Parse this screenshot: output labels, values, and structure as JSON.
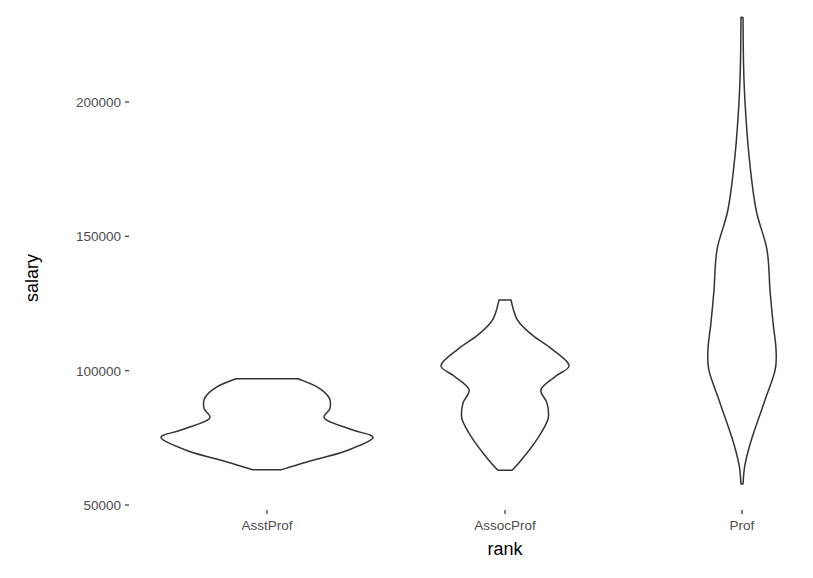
{
  "chart_data": {
    "type": "violin",
    "title": "",
    "xlabel": "rank",
    "ylabel": "salary",
    "categories": [
      "AsstProf",
      "AssocProf",
      "Prof"
    ],
    "ylim": [
      48000,
      235000
    ],
    "yticks": [
      50000,
      100000,
      150000,
      200000
    ],
    "ytick_labels": [
      "50000",
      "100000",
      "150000",
      "200000"
    ],
    "grid": false,
    "legend": null,
    "series": [
      {
        "name": "AsstProf",
        "min": 63100,
        "max": 97000,
        "modes": [
          75000,
          86000
        ],
        "density_profile": [
          {
            "y": 63100,
            "half_width": 14
          },
          {
            "y": 66000,
            "half_width": 40
          },
          {
            "y": 70000,
            "half_width": 78
          },
          {
            "y": 75000,
            "half_width": 106
          },
          {
            "y": 78000,
            "half_width": 85
          },
          {
            "y": 82000,
            "half_width": 58
          },
          {
            "y": 86000,
            "half_width": 63
          },
          {
            "y": 90000,
            "half_width": 62
          },
          {
            "y": 94000,
            "half_width": 50
          },
          {
            "y": 97000,
            "half_width": 31
          }
        ]
      },
      {
        "name": "AssocProf",
        "min": 62900,
        "max": 126300,
        "modes": [
          101000,
          88000
        ],
        "density_profile": [
          {
            "y": 62900,
            "half_width": 7
          },
          {
            "y": 67000,
            "half_width": 17
          },
          {
            "y": 75000,
            "half_width": 33
          },
          {
            "y": 82000,
            "half_width": 43
          },
          {
            "y": 88000,
            "half_width": 42
          },
          {
            "y": 93000,
            "half_width": 36
          },
          {
            "y": 98000,
            "half_width": 51
          },
          {
            "y": 102000,
            "half_width": 64
          },
          {
            "y": 108000,
            "half_width": 47
          },
          {
            "y": 113000,
            "half_width": 28
          },
          {
            "y": 118000,
            "half_width": 14
          },
          {
            "y": 122000,
            "half_width": 9
          },
          {
            "y": 126300,
            "half_width": 6
          }
        ]
      },
      {
        "name": "Prof",
        "min": 57800,
        "max": 231500,
        "modes": [
          108000
        ],
        "density_profile": [
          {
            "y": 57800,
            "half_width": 1
          },
          {
            "y": 65000,
            "half_width": 3
          },
          {
            "y": 75000,
            "half_width": 10
          },
          {
            "y": 88000,
            "half_width": 22
          },
          {
            "y": 100000,
            "half_width": 33
          },
          {
            "y": 108000,
            "half_width": 34
          },
          {
            "y": 118000,
            "half_width": 31
          },
          {
            "y": 130000,
            "half_width": 28
          },
          {
            "y": 145000,
            "half_width": 25
          },
          {
            "y": 160000,
            "half_width": 14
          },
          {
            "y": 180000,
            "half_width": 7
          },
          {
            "y": 200000,
            "half_width": 3
          },
          {
            "y": 215000,
            "half_width": 1.5
          },
          {
            "y": 231500,
            "half_width": 1
          }
        ]
      }
    ]
  }
}
